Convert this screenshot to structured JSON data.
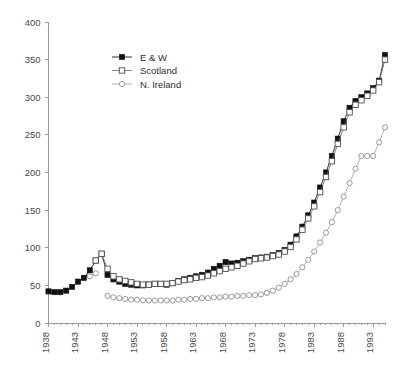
{
  "chart_data": {
    "type": "line",
    "title": "",
    "xlabel": "",
    "ylabel": "",
    "xlim": [
      1938,
      1995
    ],
    "ylim": [
      0,
      400
    ],
    "ytick_step": 50,
    "grid": false,
    "legend_position": "top-left-inset",
    "ytick_labels": [
      "0",
      "50",
      "100",
      "150",
      "200",
      "250",
      "300",
      "350",
      "400"
    ],
    "ytick_values": [
      0,
      50,
      100,
      150,
      200,
      250,
      300,
      350,
      400
    ],
    "xtick_labels": [
      "1938",
      "1943",
      "1948",
      "1953",
      "1958",
      "1963",
      "1968",
      "1973",
      "1978",
      "1983",
      "1988",
      "1993"
    ],
    "xtick_values": [
      1938,
      1943,
      1948,
      1953,
      1958,
      1963,
      1968,
      1973,
      1978,
      1983,
      1988,
      1993
    ],
    "x": [
      1938,
      1939,
      1940,
      1941,
      1942,
      1943,
      1944,
      1945,
      1946,
      1947,
      1948,
      1949,
      1950,
      1951,
      1952,
      1953,
      1954,
      1955,
      1956,
      1957,
      1958,
      1959,
      1960,
      1961,
      1962,
      1963,
      1964,
      1965,
      1966,
      1967,
      1968,
      1969,
      1970,
      1971,
      1972,
      1973,
      1974,
      1975,
      1976,
      1977,
      1978,
      1979,
      1980,
      1981,
      1982,
      1983,
      1984,
      1985,
      1986,
      1987,
      1988,
      1989,
      1990,
      1991,
      1992,
      1993,
      1994,
      1995
    ],
    "series": [
      {
        "name": "E & W",
        "marker": "filled-square",
        "color": "#111111",
        "values": [
          42,
          41,
          41,
          43,
          48,
          55,
          60,
          70,
          83,
          92,
          64,
          58,
          55,
          52,
          51,
          50,
          50,
          51,
          52,
          52,
          51,
          53,
          56,
          58,
          60,
          62,
          64,
          67,
          72,
          76,
          81,
          79,
          80,
          82,
          84,
          86,
          87,
          88,
          90,
          93,
          97,
          104,
          115,
          128,
          143,
          160,
          180,
          200,
          222,
          245,
          268,
          286,
          295,
          300,
          305,
          312,
          322,
          356
        ]
      },
      {
        "name": "Scotland",
        "marker": "open-square",
        "color": "#4f4f4f",
        "values": [
          null,
          null,
          null,
          null,
          null,
          null,
          null,
          null,
          83,
          92,
          72,
          62,
          58,
          56,
          54,
          52,
          51,
          51,
          52,
          52,
          52,
          53,
          55,
          57,
          58,
          60,
          61,
          63,
          66,
          69,
          72,
          74,
          76,
          79,
          82,
          85,
          86,
          87,
          89,
          91,
          95,
          101,
          111,
          124,
          139,
          155,
          174,
          194,
          215,
          238,
          260,
          280,
          290,
          296,
          302,
          309,
          320,
          350
        ]
      },
      {
        "name": "N. Ireland",
        "marker": "open-circle",
        "color": "#8f8f8f",
        "values": [
          null,
          null,
          null,
          null,
          null,
          null,
          null,
          62,
          66,
          null,
          36,
          34,
          33,
          32,
          31,
          31,
          30,
          30,
          30,
          30,
          30,
          30,
          31,
          31,
          32,
          32,
          33,
          33,
          34,
          34,
          35,
          35,
          36,
          36,
          37,
          37,
          38,
          40,
          43,
          47,
          52,
          58,
          65,
          74,
          84,
          95,
          107,
          120,
          134,
          150,
          168,
          186,
          205,
          222,
          222,
          222,
          240,
          260
        ]
      }
    ]
  },
  "legend": {
    "items": [
      {
        "label": "E & W"
      },
      {
        "label": "Scotland"
      },
      {
        "label": "N. Ireland"
      }
    ]
  }
}
